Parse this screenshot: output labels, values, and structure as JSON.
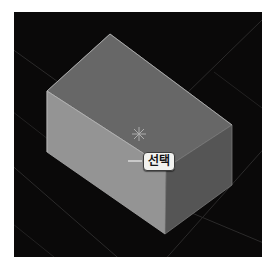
{
  "viewport": {
    "name": "3d-viewport",
    "background_color": "#0a0909",
    "border_color": "#ffffff"
  },
  "scene": {
    "object_name": "box",
    "faces": [
      {
        "name": "top-face",
        "color": "#6b6b6b"
      },
      {
        "name": "front-face",
        "color": "#949494"
      },
      {
        "name": "right-face",
        "color": "#555555"
      }
    ],
    "edge_color": "#a8a8a8",
    "grid_color": "#2a2a2a"
  },
  "callout": {
    "label": "선택",
    "leader_color": "#c9c9c9",
    "chip_background": "#f2f2ef",
    "chip_border": "#3c3c3c",
    "chip_text_color": "#141414"
  },
  "cursor": {
    "marker": "asterisk-marker",
    "color": "#b8b8b8"
  }
}
